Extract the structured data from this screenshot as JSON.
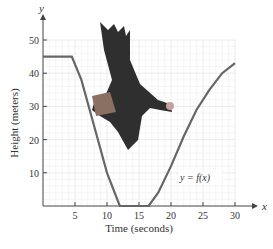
{
  "chart_data": {
    "type": "line",
    "title": "",
    "xlabel": "Time (seconds)",
    "ylabel": "Height (meters)",
    "x_axis_symbol": "x",
    "y_axis_symbol": "y",
    "xlim": [
      0,
      30
    ],
    "ylim": [
      0,
      50
    ],
    "x_ticks": [
      5,
      10,
      15,
      20,
      25,
      30
    ],
    "y_ticks": [
      10,
      20,
      30,
      40,
      50
    ],
    "grid": true,
    "annotation": "y = f(x)",
    "series": [
      {
        "name": "y = f(x)",
        "x": [
          0,
          4.5,
          6,
          8,
          10,
          12,
          16.5,
          18,
          20,
          22,
          24,
          26,
          28,
          30
        ],
        "y": [
          45,
          45,
          38,
          24,
          10,
          0,
          0,
          4,
          12,
          21,
          29,
          35,
          40,
          43
        ]
      }
    ],
    "image": "eagle-illustration"
  }
}
